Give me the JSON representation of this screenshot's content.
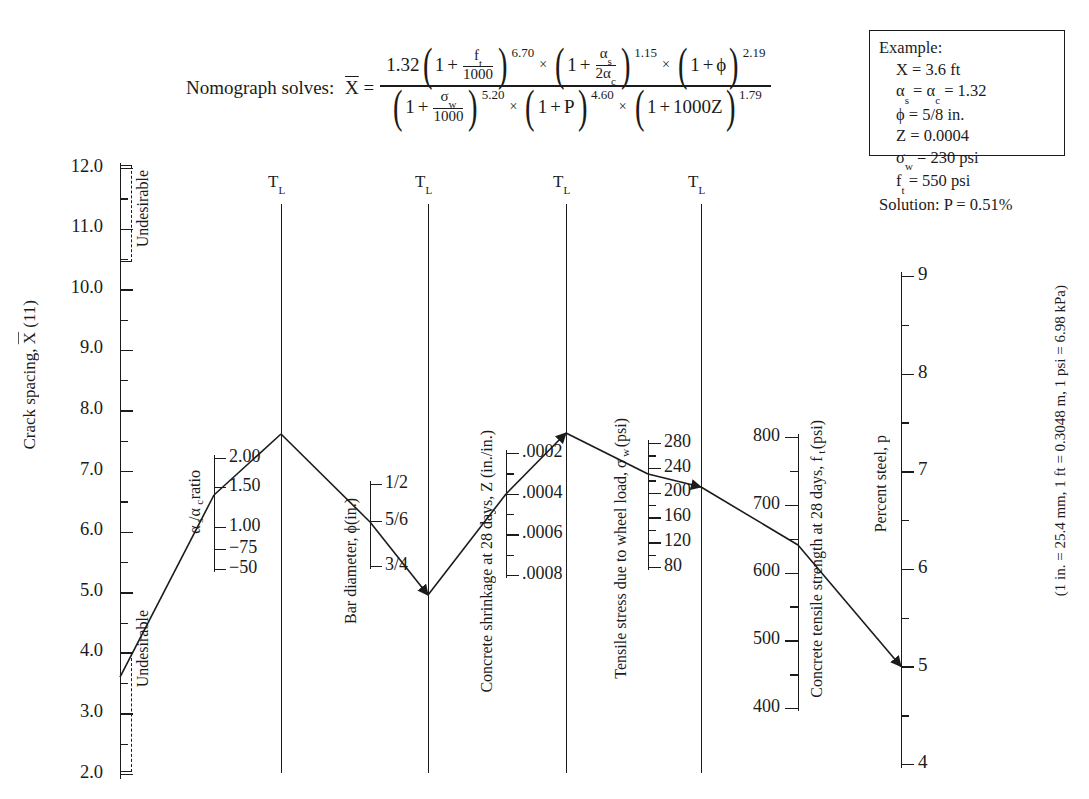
{
  "figure": {
    "formula_lead": "Nomograph solves:",
    "formula_lhs": "X̅ =",
    "formula": {
      "numerator": "1.32 (1 + f_t/1000)^6.70 × (1 + α_s/2α_c)^1.15 × (1 + ϕ)^2.19",
      "denominator": "(1 + σ_w/1000)^5.20 × (1 + P)^4.60 × (1 + 1000Z)^1.79",
      "coef": "1.32",
      "exp_ft": "6.70",
      "exp_alpha": "1.15",
      "exp_phi": "2.19",
      "exp_sigma": "5.20",
      "exp_P": "4.60",
      "exp_Z": "1.79",
      "ft_sym": "f",
      "ft_sub": "t",
      "thousand": "1000",
      "alpha_s_sym": "α",
      "alpha_s_sub": "s",
      "alpha_c_den": "2α",
      "alpha_c_sub": "c",
      "phi_sym": "ϕ",
      "sigma_sym": "σ",
      "sigma_sub": "w",
      "P_sym": "P",
      "Z_sym": "1000Z",
      "one": "1",
      "plus": "+",
      "times": "×"
    },
    "footnote": "(1 in. = 25.4 mm, 1 ft = 0.3048 m, 1 psi = 6.98 kPa)"
  },
  "example": {
    "title": "Example:",
    "lines": [
      "X = 3.6 ft",
      "αs = αc = 1.32",
      "ϕ = 5/8 in.",
      "Z = 0.0004",
      "σw = 230 psi",
      "ft = 550 psi"
    ],
    "line_parts": [
      {
        "a": "X",
        "sub": "",
        "b": " = 3.6 ft"
      },
      {
        "a": "α",
        "sub": "s",
        "b": " = α",
        "sub2": "c",
        "c": " = 1.32"
      },
      {
        "a": "ϕ",
        "sub": "",
        "b": " = 5/8 in."
      },
      {
        "a": "Z",
        "sub": "",
        "b": " = 0.0004"
      },
      {
        "a": "σ",
        "sub": "w",
        "b": " = 230 psi"
      },
      {
        "a": "f",
        "sub": "t",
        "b": " = 550 psi"
      }
    ],
    "solution": "Solution: P = 0.51%"
  },
  "turning_lines": {
    "label": "T",
    "sub": "L",
    "count": 4
  },
  "chart_data": {
    "type": "nomograph",
    "axes": [
      {
        "id": "crack-spacing",
        "title": "Crack spacing, X̅ (11)",
        "title_plain": "Crack spacing, X (11)",
        "major_ticks": [
          "12.0",
          "11.0",
          "10.0",
          "9.0",
          "8.0",
          "7.0",
          "6.0",
          "5.0",
          "4.0",
          "3.0",
          "2.0"
        ],
        "values": [
          12.0,
          11.0,
          10.0,
          9.0,
          8.0,
          7.0,
          6.0,
          5.0,
          4.0,
          3.0,
          2.0
        ],
        "minor_between": true,
        "undesirable_upper": "Undesirable",
        "undesirable_lower": "Undesirable",
        "reading": 3.6
      },
      {
        "id": "alpha-ratio",
        "title": "αs/αc ratio",
        "title_parts": {
          "a": "α",
          "sub_a": "s",
          "slash": "/",
          "b": "α",
          "sub_b": "c",
          "rest": " ratio"
        },
        "major_ticks": [
          "2.00",
          "1.50",
          "1.00",
          "−75",
          "−50"
        ],
        "values": [
          2.0,
          1.5,
          1.0,
          0.75,
          0.5
        ],
        "reading": 1.32
      },
      {
        "id": "bar-diameter",
        "title": "Bar diameter, ϕ(in.)",
        "title_parts": {
          "a": "Bar diameter, ",
          "sym": "ϕ",
          "rest": "(in.)"
        },
        "major_ticks": [
          "1/2",
          "5/6",
          "3/4"
        ],
        "reading": "5/8"
      },
      {
        "id": "concrete-shrinkage",
        "title": "Concrete shrinkage at 28 days, Z (in./in.)",
        "major_ticks": [
          ".0002",
          ".0004",
          ".0006",
          ".0008"
        ],
        "values": [
          0.0002,
          0.0004,
          0.0006,
          0.0008
        ],
        "reading": 0.0004
      },
      {
        "id": "tensile-stress",
        "title": "Tensile stress due to wheel load, σw (psi)",
        "title_parts": {
          "a": "Tensile stress due to wheel load, ",
          "sym": "σ",
          "sub": "w",
          "rest": " (psi)"
        },
        "major_ticks": [
          "280",
          "240",
          "200",
          "160",
          "120",
          "80"
        ],
        "values": [
          280,
          240,
          200,
          160,
          120,
          80
        ],
        "minor_step": 20,
        "reading": 230
      },
      {
        "id": "tensile-strength",
        "title": "Concrete tensile strength at 28 days, ft (psi)",
        "title_parts": {
          "a": "Concrete tensile strength at 28 days, ",
          "sym": "f",
          "sub": "t",
          "rest": " (psi)"
        },
        "major_ticks": [
          "800",
          "700",
          "600",
          "500",
          "400"
        ],
        "values": [
          800,
          700,
          600,
          500,
          400
        ],
        "minor_step": 50,
        "reading": 550
      },
      {
        "id": "percent-steel",
        "title": "Percent steel, p",
        "major_ticks": [
          "9",
          "8",
          "7",
          "6",
          "5",
          "4"
        ],
        "values": [
          9,
          8,
          7,
          6,
          5,
          4
        ],
        "minor_step": 0.5,
        "reading": 5
      }
    ],
    "construction_path": [
      {
        "axis": "crack-spacing",
        "value": 3.6
      },
      {
        "axis": "alpha-ratio",
        "value": 1.32
      },
      {
        "axis": "turning-line-1",
        "value": null
      },
      {
        "axis": "bar-diameter",
        "value": "5/8"
      },
      {
        "axis": "turning-line-2",
        "value": null
      },
      {
        "axis": "concrete-shrinkage",
        "value": 0.0004
      },
      {
        "axis": "turning-line-3",
        "value": null
      },
      {
        "axis": "tensile-stress",
        "value": 230
      },
      {
        "axis": "turning-line-4",
        "value": null
      },
      {
        "axis": "tensile-strength",
        "value": 550
      },
      {
        "axis": "percent-steel",
        "value": 5
      }
    ]
  }
}
